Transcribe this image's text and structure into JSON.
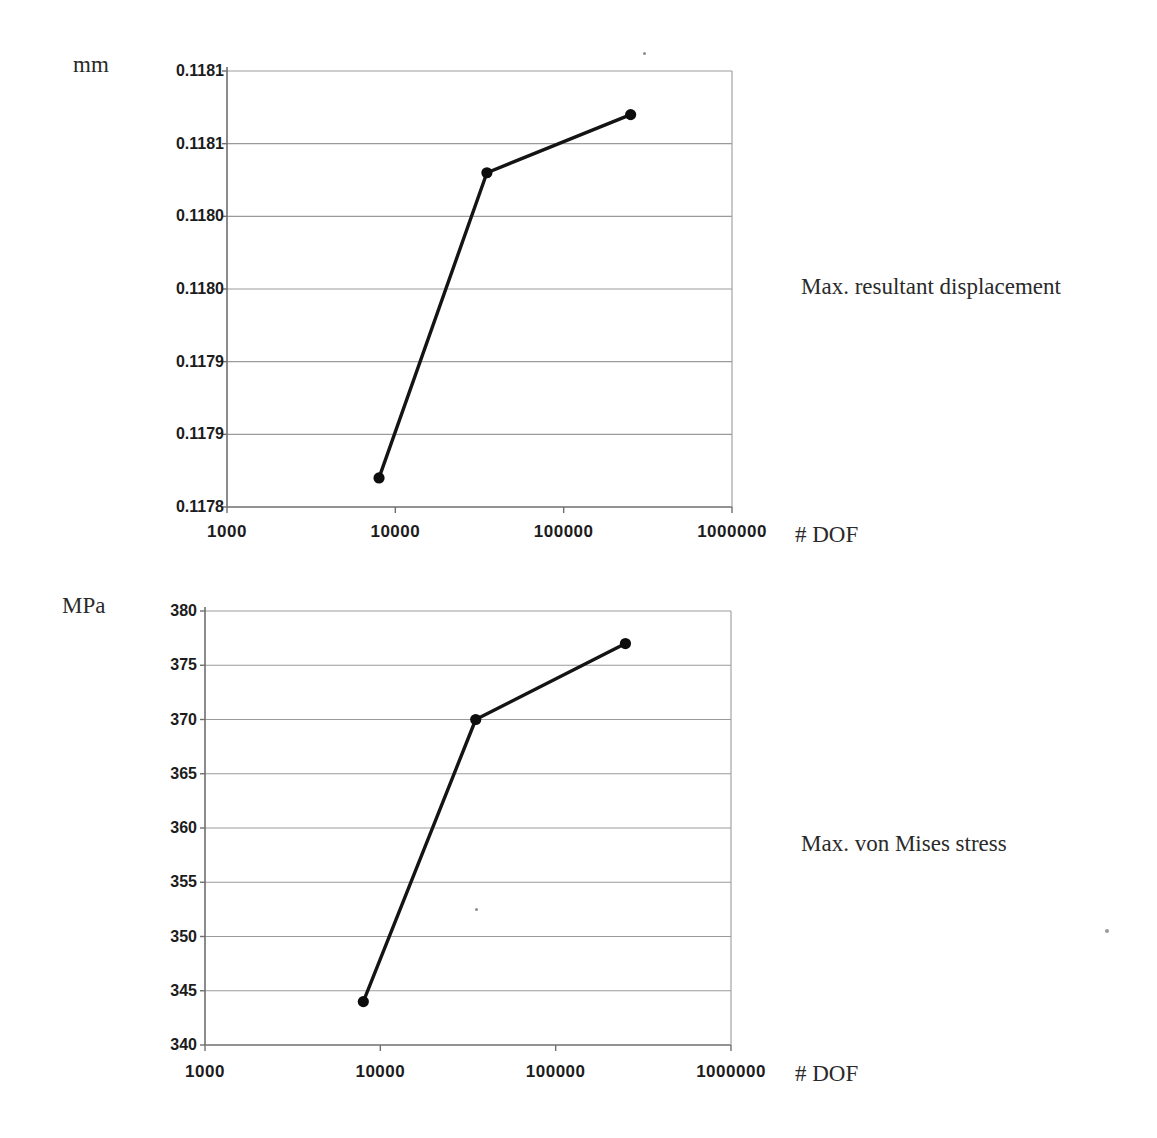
{
  "figure": {
    "background": "#ffffff",
    "description_visible_text_only": true
  },
  "colors": {
    "grid": "#9b9b9b",
    "axis": "#6f6f6f",
    "line": "#141414",
    "marker": "#0d0d0d",
    "tick_text": "#1c1c1c",
    "label_text": "#2a2a2a"
  },
  "chart_data": [
    {
      "type": "line",
      "title": "Max. resultant displacement",
      "xlabel": "# DOF",
      "ylabel": "mm",
      "x_scale": "log",
      "x": [
        8000,
        35000,
        250000
      ],
      "y": [
        0.11782,
        0.11803,
        0.11807
      ],
      "xlim": [
        1000,
        1000000
      ],
      "ylim": [
        0.1178,
        0.1181
      ],
      "x_tick_values": [
        1000,
        10000,
        100000,
        1000000
      ],
      "x_tick_labels": [
        "1000",
        "10000",
        "100000",
        "1000000"
      ],
      "y_tick_values": [
        0.1181,
        0.11805,
        0.118,
        0.11795,
        0.1179,
        0.11785,
        0.1178
      ],
      "y_tick_labels": [
        "0.1181",
        "0.1181",
        "0.1180",
        "0.1180",
        "0.1179",
        "0.1179",
        "0.1178"
      ],
      "grid": true,
      "legend": "none",
      "marker": "filled-circle"
    },
    {
      "type": "line",
      "title": "Max. von Mises stress",
      "xlabel": "# DOF",
      "ylabel": "MPa",
      "x_scale": "log",
      "x": [
        8000,
        35000,
        250000
      ],
      "y": [
        344,
        370,
        377
      ],
      "xlim": [
        1000,
        1000000
      ],
      "ylim": [
        340,
        380
      ],
      "x_tick_values": [
        1000,
        10000,
        100000,
        1000000
      ],
      "x_tick_labels": [
        "1000",
        "10000",
        "100000",
        "1000000"
      ],
      "y_tick_values": [
        380,
        375,
        370,
        365,
        360,
        355,
        350,
        345,
        340
      ],
      "y_tick_labels": [
        "380",
        "375",
        "370",
        "365",
        "360",
        "355",
        "350",
        "345",
        "340"
      ],
      "grid": true,
      "legend": "none",
      "marker": "filled-circle"
    }
  ]
}
